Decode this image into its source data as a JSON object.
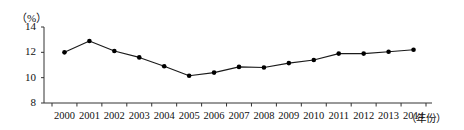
{
  "chart_data": {
    "type": "line",
    "title": "",
    "subtitle": "",
    "xlabel": "（年份）",
    "ylabel": "（%）",
    "categories": [
      "2000",
      "2001",
      "2002",
      "2003",
      "2004",
      "2005",
      "2006",
      "2007",
      "2008",
      "2009",
      "2010",
      "2011",
      "2012",
      "2013",
      "2014"
    ],
    "values": [
      12.0,
      12.9,
      12.1,
      11.6,
      10.9,
      10.15,
      10.4,
      10.85,
      10.8,
      11.15,
      11.4,
      11.9,
      11.9,
      12.05,
      12.2
    ],
    "series": [
      {
        "name": "",
        "values": [
          12.0,
          12.9,
          12.1,
          11.6,
          10.9,
          10.15,
          10.4,
          10.85,
          10.8,
          11.15,
          11.4,
          11.9,
          11.9,
          12.05,
          12.2
        ]
      }
    ],
    "ylim": [
      8,
      14
    ],
    "yticks": [
      8,
      10,
      12,
      14
    ],
    "ytick_labels": [
      "8",
      "10",
      "12",
      "14"
    ],
    "xtick_labels": [
      "2000",
      "2001",
      "2002",
      "2003",
      "2004",
      "2005",
      "2006",
      "2007",
      "2008",
      "2009",
      "2010",
      "2011",
      "2012",
      "2013",
      "2014"
    ],
    "grid": false,
    "legend": "none",
    "marker": "filled-circle",
    "line_color": "#1a1a1a",
    "marker_color": "#000000",
    "axis_color": "#333333",
    "background_color": "#ffffff"
  }
}
